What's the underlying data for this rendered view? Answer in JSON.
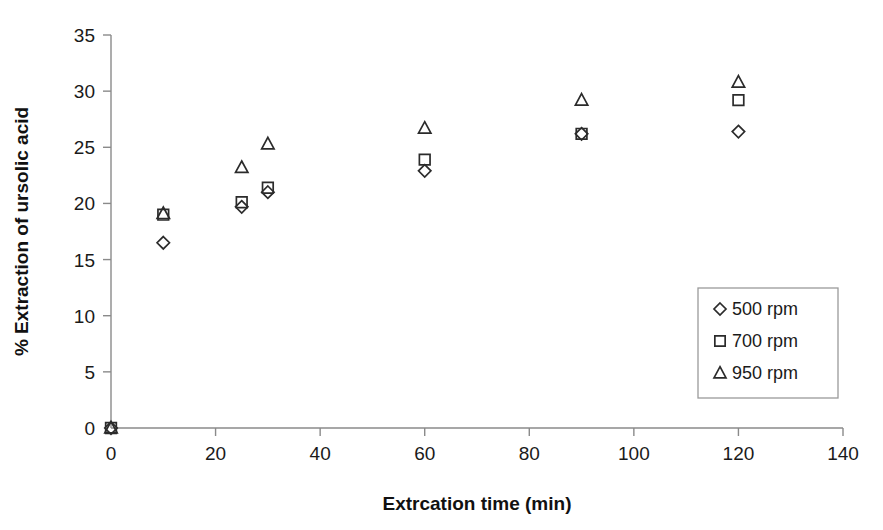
{
  "chart_data": {
    "type": "scatter",
    "title": "",
    "xlabel": "Extrcation time (min)",
    "ylabel": "% Extraction of ursolic acid",
    "xlim": [
      0,
      140
    ],
    "ylim": [
      0,
      35
    ],
    "xticks": [
      0,
      20,
      40,
      60,
      80,
      100,
      120,
      140
    ],
    "yticks": [
      0,
      5,
      10,
      15,
      20,
      25,
      30,
      35
    ],
    "xtick_labels": [
      "0",
      "20",
      "40",
      "60",
      "80",
      "100",
      "120",
      "140"
    ],
    "ytick_labels": [
      "0",
      "5",
      "10",
      "15",
      "20",
      "25",
      "30",
      "35"
    ],
    "grid": false,
    "legend_position": "lower-right",
    "x": [
      0,
      10,
      25,
      30,
      60,
      90,
      120
    ],
    "series": [
      {
        "name": "500 rpm",
        "marker": "diamond",
        "color": "#2b2b2b",
        "values": [
          0,
          16.5,
          19.7,
          21.0,
          22.9,
          26.2,
          26.4
        ]
      },
      {
        "name": "700 rpm",
        "marker": "square",
        "color": "#2b2b2b",
        "values": [
          0,
          19.0,
          20.1,
          21.4,
          23.9,
          26.2,
          29.2
        ]
      },
      {
        "name": "950 rpm",
        "marker": "triangle",
        "color": "#2b2b2b",
        "values": [
          0,
          19.1,
          23.2,
          25.3,
          26.7,
          29.2,
          30.8
        ]
      }
    ]
  },
  "legend": {
    "entries": [
      {
        "label": "500 rpm",
        "marker": "diamond"
      },
      {
        "label": "700 rpm",
        "marker": "square"
      },
      {
        "label": "950 rpm",
        "marker": "triangle"
      }
    ]
  }
}
